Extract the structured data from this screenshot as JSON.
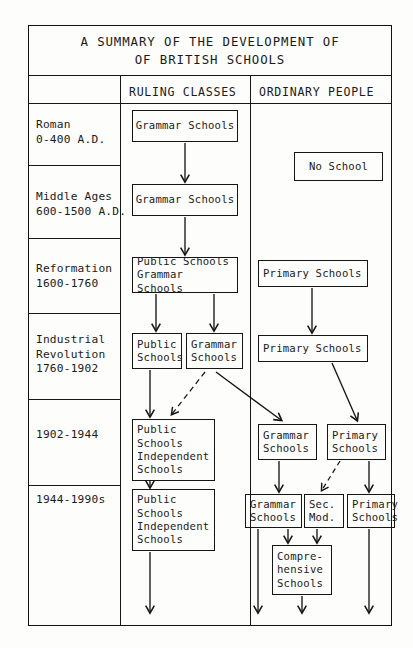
{
  "document": {
    "title_line1": "A SUMMARY OF THE DEVELOPMENT OF",
    "title_line2": "OF BRITISH SCHOOLS",
    "title": "A SUMMARY OF THE DEVELOPMENT OF\nOF BRITISH SCHOOLS"
  },
  "columns": {
    "era_header": "",
    "ruling_classes": "RULING CLASSES",
    "ordinary_people": "ORDINARY PEOPLE"
  },
  "eras": [
    {
      "id": "roman",
      "label": "Roman\n0-400 A.D."
    },
    {
      "id": "middle",
      "label": "Middle Ages\n600-1500 A.D."
    },
    {
      "id": "reformation",
      "label": "Reformation\n1600-1760"
    },
    {
      "id": "industrial",
      "label": "Industrial\nRevolution\n1760-1902"
    },
    {
      "id": "c1902",
      "label": "1902-1944"
    },
    {
      "id": "c1944",
      "label": "1944-1990s"
    }
  ],
  "boxes": {
    "ruling": {
      "roman_grammar": "Grammar Schools",
      "middle_grammar": "Grammar Schools",
      "reformation_public_grammar": "Public Schools\nGrammar Schools",
      "industrial_public": "Public\nSchools",
      "industrial_grammar": "Grammar\nSchools",
      "c1902_public_independent": "Public\nSchools\nIndependent\nSchools",
      "c1944_public_independent": "Public\nSchools\nIndependent\nSchools"
    },
    "ordinary": {
      "roman_no_school": "No School",
      "reformation_primary": "Primary Schools",
      "industrial_primary": "Primary Schools",
      "c1902_grammar": "Grammar\nSchools",
      "c1902_primary": "Primary\nSchools",
      "c1944_grammar": "Grammar\nSchools",
      "c1944_secmod": "Sec.\nMod.",
      "c1944_primary": "Primary\nSchools",
      "c1944_comprehensive": "Compre-\nhensive\nSchools"
    }
  },
  "colors": {
    "ink": "#151515",
    "paper": "#fdfdfc"
  }
}
